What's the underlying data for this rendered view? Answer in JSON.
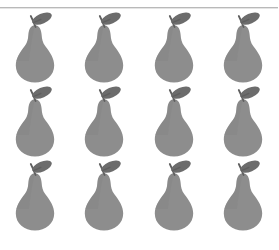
{
  "page": {
    "background_color": "#ffffff",
    "width": 278,
    "height": 250
  },
  "divider": {
    "name": "horizontal-rule",
    "color": "#b9b9b9",
    "shadow_color": "#e4e4e4",
    "y": 7
  },
  "grid": {
    "columns": 4,
    "rows": 3,
    "total_icons": 12,
    "icon_name": "pear-icon",
    "clipped_bottom_row": true
  },
  "icon": {
    "name": "pear-icon",
    "body_color": "#8d8d8d",
    "body_shade_color": "#848484",
    "leaf_color": "#6c6c6c",
    "stem_color": "#5f5f5f"
  },
  "items": [
    {
      "name": "pear-icon",
      "row": 1,
      "col": 1
    },
    {
      "name": "pear-icon",
      "row": 1,
      "col": 2
    },
    {
      "name": "pear-icon",
      "row": 1,
      "col": 3
    },
    {
      "name": "pear-icon",
      "row": 1,
      "col": 4
    },
    {
      "name": "pear-icon",
      "row": 2,
      "col": 1
    },
    {
      "name": "pear-icon",
      "row": 2,
      "col": 2
    },
    {
      "name": "pear-icon",
      "row": 2,
      "col": 3
    },
    {
      "name": "pear-icon",
      "row": 2,
      "col": 4
    },
    {
      "name": "pear-icon",
      "row": 3,
      "col": 1
    },
    {
      "name": "pear-icon",
      "row": 3,
      "col": 2
    },
    {
      "name": "pear-icon",
      "row": 3,
      "col": 3
    },
    {
      "name": "pear-icon",
      "row": 3,
      "col": 4
    }
  ]
}
